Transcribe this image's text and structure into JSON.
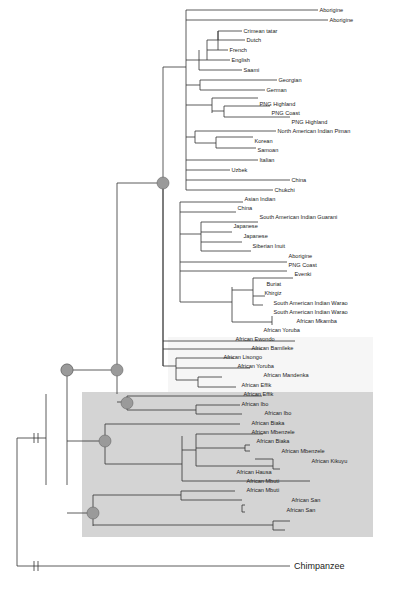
{
  "figure": {
    "type": "phylogenetic-tree",
    "outgroup_label": "Chimpanzee",
    "highlight_color": "#d4d4d4",
    "faint_region_color": "#f5f5f5",
    "node_color": "#9a9a9a"
  },
  "leaves": [
    "Aborigine",
    "Aborigine",
    "Crimean tatar",
    "Dutch",
    "French",
    "English",
    "Saami",
    "Georgian",
    "German",
    "PNG Highland",
    "PNG Coast",
    "PNG Highland",
    "North American Indian Piman",
    "Korean",
    "Samoan",
    "Italian",
    "Uzbek",
    "China",
    "Chukchi",
    "Asian Indian",
    "China",
    "South American Indian Guarani",
    "Japanese",
    "Japanese",
    "Siberian Inuit",
    "Aborigine",
    "PNG Coast",
    "Evenki",
    "Buriat",
    "Khirgiz",
    "South American Indian Warao",
    "South American Indian Warao",
    "African Mkamba",
    "African Yoruba",
    "African Ewondo",
    "African Bamileke",
    "African Lisongo",
    "African Yoruba",
    "African Mandenka",
    "African Effik",
    "African Effik",
    "African Ibo",
    "African Ibo",
    "African Biaka",
    "African Mbenzele",
    "African Biaka",
    "African Mbenzele",
    "African Kikuyu",
    "African Hausa",
    "African Mbuti",
    "African Mbuti",
    "African San",
    "African San",
    "Chimpanzee"
  ]
}
